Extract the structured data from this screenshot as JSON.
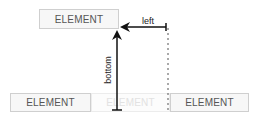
{
  "diagram": {
    "top_element": {
      "label": "ELEMENT"
    },
    "bottom_row": [
      {
        "label": "ELEMENT"
      },
      {
        "label": "ELEMENT",
        "faded": true
      },
      {
        "label": "ELEMENT"
      }
    ],
    "arrows": {
      "left_label": "left",
      "bottom_label": "bottom"
    }
  }
}
